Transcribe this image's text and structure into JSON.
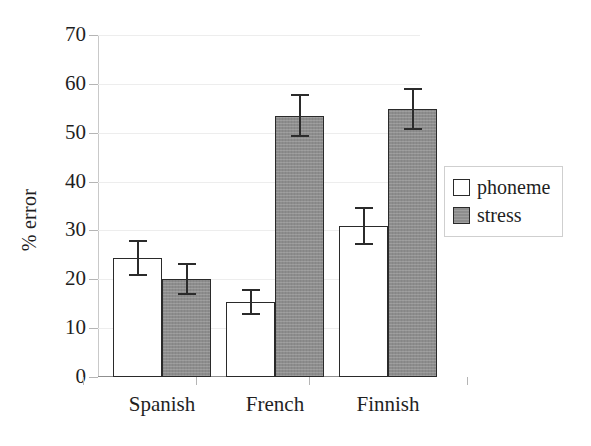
{
  "chart_data": {
    "type": "bar",
    "title": "",
    "xlabel": "",
    "ylabel": "% error",
    "categories": [
      "Spanish",
      "French",
      "Finnish"
    ],
    "ylim": [
      0,
      70
    ],
    "yticks": [
      0,
      10,
      20,
      30,
      40,
      50,
      60,
      70
    ],
    "grid": true,
    "legend_position": "right",
    "series": [
      {
        "name": "phoneme",
        "color": "#ffffff",
        "values": [
          24.4,
          15.4,
          30.9
        ],
        "errors": [
          3.5,
          2.5,
          3.6
        ]
      },
      {
        "name": "stress",
        "color": "#8d8d8d",
        "values": [
          20.1,
          53.5,
          54.8
        ],
        "errors": [
          3.1,
          4.2,
          4.1
        ]
      }
    ]
  },
  "axis": {
    "y_label": "% error",
    "tick_labels": [
      "0",
      "10",
      "20",
      "30",
      "40",
      "50",
      "60",
      "70"
    ]
  },
  "legend": {
    "items": [
      {
        "label": "phoneme",
        "swatch": "open-square-icon"
      },
      {
        "label": "stress",
        "swatch": "filled-square-icon"
      }
    ]
  }
}
